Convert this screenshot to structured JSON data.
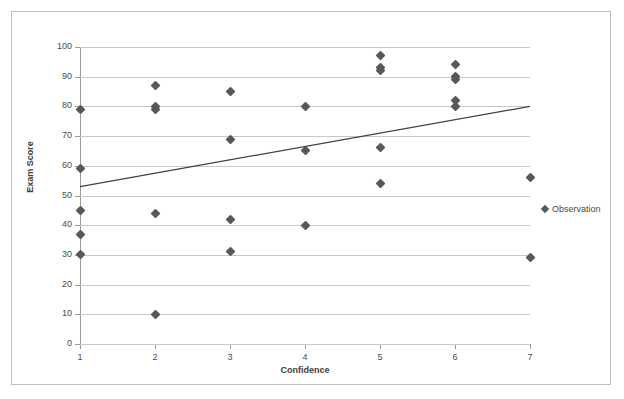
{
  "chart_data": {
    "type": "scatter",
    "title": "",
    "xlabel": "Confidence",
    "ylabel": "Exam Score",
    "xlim": [
      1,
      7
    ],
    "ylim": [
      0,
      100
    ],
    "xticks": [
      1,
      2,
      3,
      4,
      5,
      6,
      7
    ],
    "yticks": [
      0,
      10,
      20,
      30,
      40,
      50,
      60,
      70,
      80,
      90,
      100
    ],
    "grid": "horizontal",
    "legend_position": "right",
    "series": [
      {
        "name": "Observation",
        "marker": "diamond",
        "color": "#585858",
        "points": [
          {
            "x": 1,
            "y": 79
          },
          {
            "x": 1,
            "y": 59
          },
          {
            "x": 1,
            "y": 45
          },
          {
            "x": 1,
            "y": 37
          },
          {
            "x": 1,
            "y": 30
          },
          {
            "x": 2,
            "y": 87
          },
          {
            "x": 2,
            "y": 80
          },
          {
            "x": 2,
            "y": 79
          },
          {
            "x": 2,
            "y": 44
          },
          {
            "x": 2,
            "y": 10
          },
          {
            "x": 3,
            "y": 85
          },
          {
            "x": 3,
            "y": 69
          },
          {
            "x": 3,
            "y": 42
          },
          {
            "x": 3,
            "y": 31
          },
          {
            "x": 4,
            "y": 80
          },
          {
            "x": 4,
            "y": 65
          },
          {
            "x": 4,
            "y": 40
          },
          {
            "x": 5,
            "y": 97
          },
          {
            "x": 5,
            "y": 93
          },
          {
            "x": 5,
            "y": 92
          },
          {
            "x": 5,
            "y": 66
          },
          {
            "x": 5,
            "y": 54
          },
          {
            "x": 6,
            "y": 94
          },
          {
            "x": 6,
            "y": 90
          },
          {
            "x": 6,
            "y": 89
          },
          {
            "x": 6,
            "y": 82
          },
          {
            "x": 6,
            "y": 80
          },
          {
            "x": 7,
            "y": 56
          },
          {
            "x": 7,
            "y": 29
          }
        ]
      }
    ],
    "trendline": {
      "name": "linear-fit",
      "color": "#404040",
      "x_start": 1,
      "y_start": 53,
      "x_end": 7,
      "y_end": 80
    }
  },
  "legend": {
    "entries": [
      {
        "label": "Observation",
        "marker": "diamond-icon",
        "color": "#585858"
      }
    ]
  },
  "axes": {
    "x": {
      "label": "Confidence",
      "tick_labels": [
        "1",
        "2",
        "3",
        "4",
        "5",
        "6",
        "7"
      ]
    },
    "y": {
      "label": "Exam Score",
      "tick_labels": [
        "0",
        "10",
        "20",
        "30",
        "40",
        "50",
        "60",
        "70",
        "80",
        "90",
        "100"
      ]
    }
  },
  "colors": {
    "marker": "#585858",
    "gridline": "#c8c8c8",
    "axis": "#9a9a9a",
    "frame": "#bfbfbf",
    "text": "#4a4a4a",
    "trendline": "#404040"
  }
}
